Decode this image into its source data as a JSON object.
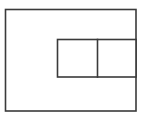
{
  "figure": {
    "title": "Nested rectangles diagram",
    "background_color": "#ffffff",
    "line_color": "#3a3a3a",
    "fill_color": "#ffffff",
    "stroke_width": 1.6,
    "canvas": {
      "width": 144,
      "height": 120
    },
    "shapes": {
      "outer_rectangle": {
        "label": "Outer rectangle",
        "x": 5.5,
        "y": 9.5,
        "width": 130.5,
        "height": 101.5
      },
      "inner_rectangle": {
        "label": "Inner rectangle",
        "x": 57.5,
        "y": 39.5,
        "width": 78.5,
        "height": 37.5
      },
      "inner_divider": {
        "label": "Vertical divider line",
        "x1": 97.5,
        "y1": 39.5,
        "x2": 97.5,
        "y2": 77
      }
    },
    "cells": {
      "inner_left_cell": {
        "label": "Inner left cell"
      },
      "inner_right_cell": {
        "label": "Inner right cell"
      },
      "outer_region": {
        "label": "Outer region"
      }
    }
  }
}
